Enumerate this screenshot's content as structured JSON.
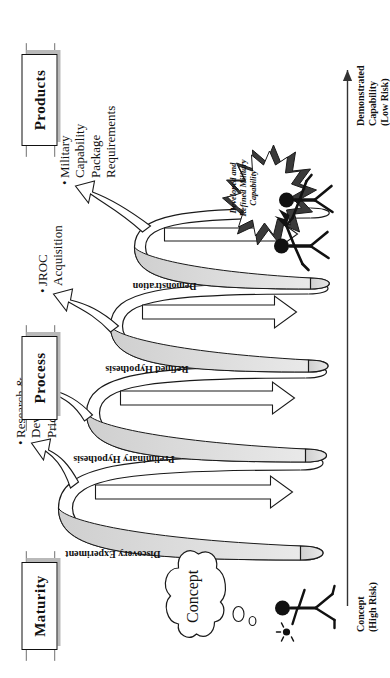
{
  "figure": {
    "orientation": "rotated-90-ccw",
    "banners": [
      {
        "id": "maturity",
        "label": "Maturity"
      },
      {
        "id": "process",
        "label": "Process"
      },
      {
        "id": "products",
        "label": "Products"
      }
    ],
    "concept_cloud": {
      "label": "Concept"
    },
    "axis": {
      "start_label_line1": "Concept",
      "start_label_line2": "(High Risk)",
      "end_label_line1": "Demonstrated",
      "end_label_line2": "Capability",
      "end_label_line3": "(Low Risk)"
    },
    "spiral_stages": [
      {
        "id": "stage-1",
        "label": "Discovery Experiment"
      },
      {
        "id": "stage-2",
        "label": "Preliminary Hypothesis"
      },
      {
        "id": "stage-3",
        "label": "Refined Hypothesis"
      },
      {
        "id": "stage-4",
        "label": "Demonstration"
      }
    ],
    "output_arrows": [
      {
        "id": "out-1",
        "bullet": "•",
        "line1": "Research &",
        "line2": "Development",
        "line3": "Priorities"
      },
      {
        "id": "out-2",
        "bullet": "",
        "line1": "",
        "line2": "",
        "line3": ""
      },
      {
        "id": "out-3",
        "bullet": "•",
        "line1": "JROC",
        "line2": "Acquisition",
        "line3": ""
      },
      {
        "id": "out-4",
        "bullet": "•",
        "line1": "Military",
        "line2": "Capability",
        "line3": "Package",
        "line4": "Requirements"
      }
    ],
    "starburst": {
      "line1": "Developed and",
      "line2": "Refined Military",
      "line3": "Capability"
    },
    "figures": {
      "idea_person": "stick-figure-with-idea-lightbulb",
      "celebrating_people": "two-celebrating-stick-figures"
    },
    "colors": {
      "ink": "#111111",
      "ribbon_shadow": "#b9b9b9",
      "spiral_fill": "#d9d9d9",
      "paper": "#ffffff"
    }
  }
}
